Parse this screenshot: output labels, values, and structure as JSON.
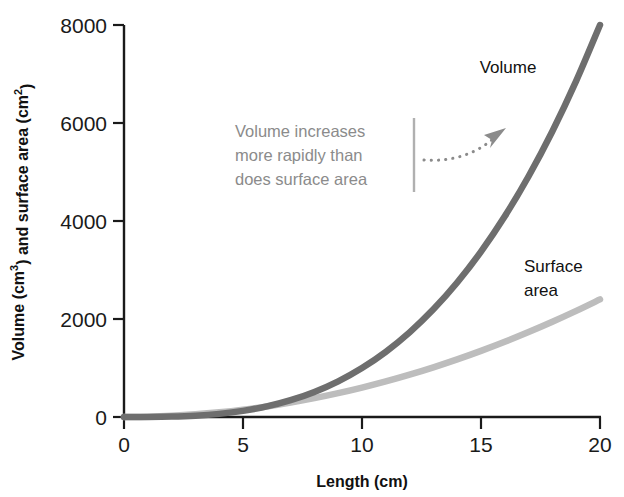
{
  "chart_data": {
    "type": "line",
    "title": "",
    "xlabel": "Length (cm)",
    "ylabel": "Volume (cm3) and surface area (cm2)",
    "ylabel_parts": {
      "lead": "Volume (cm",
      "exp1": "3",
      "mid": ") and surface area (cm",
      "exp2": "2",
      "tail": ")"
    },
    "xlim": [
      0,
      20
    ],
    "ylim": [
      0,
      8000
    ],
    "grid": false,
    "legend_position": "inline-labels",
    "xticks": [
      0,
      5,
      10,
      15,
      20
    ],
    "xtick_labels": [
      "0",
      "5",
      "10",
      "15",
      "20"
    ],
    "yticks": [
      0,
      2000,
      4000,
      6000,
      8000
    ],
    "ytick_labels": [
      "0",
      "2000",
      "4000",
      "6000",
      "8000"
    ],
    "x": [
      0,
      1,
      2,
      3,
      4,
      5,
      6,
      7,
      8,
      9,
      10,
      11,
      12,
      13,
      14,
      15,
      16,
      17,
      18,
      19,
      20
    ],
    "series": [
      {
        "name": "Volume",
        "label": "Volume",
        "color": "#6e6e6e",
        "formula": "L^3",
        "units": "cm3",
        "values": [
          0,
          1,
          8,
          27,
          64,
          125,
          216,
          343,
          512,
          729,
          1000,
          1331,
          1728,
          2197,
          2744,
          3375,
          4096,
          4913,
          5832,
          6859,
          8000
        ]
      },
      {
        "name": "Surface area",
        "label": "Surface area",
        "label_line1": "Surface",
        "label_line2": "area",
        "color": "#bdbdbd",
        "formula": "6L^2",
        "units": "cm2",
        "values": [
          0,
          6,
          24,
          54,
          96,
          150,
          216,
          294,
          384,
          486,
          600,
          726,
          864,
          1014,
          1176,
          1350,
          1536,
          1734,
          1944,
          2166,
          2400
        ]
      }
    ],
    "annotations": [
      {
        "id": "volume-vs-surface-note",
        "lines": [
          "Volume increases",
          "more rapidly than",
          "does surface area"
        ],
        "color": "#8b8b8b",
        "has_divider_bar": true,
        "has_dotted_arrow": true,
        "arrow_style": "dotted-curved",
        "points_to": "Volume curve"
      }
    ]
  },
  "colors": {
    "axis": "#1a1a1a",
    "background": "#ffffff",
    "volume": "#6e6e6e",
    "surface_area": "#bdbdbd",
    "annotation": "#8b8b8b",
    "text": "#111111"
  }
}
